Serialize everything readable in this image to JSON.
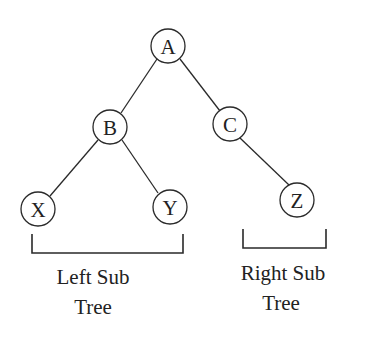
{
  "diagram": {
    "type": "binary-tree",
    "nodes": [
      {
        "id": "A",
        "label": "A",
        "cx": 168,
        "cy": 46,
        "r": 17
      },
      {
        "id": "B",
        "label": "B",
        "cx": 110,
        "cy": 127,
        "r": 17
      },
      {
        "id": "C",
        "label": "C",
        "cx": 230,
        "cy": 124,
        "r": 17
      },
      {
        "id": "X",
        "label": "X",
        "cx": 38,
        "cy": 209,
        "r": 17
      },
      {
        "id": "Y",
        "label": "Y",
        "cx": 170,
        "cy": 207,
        "r": 17
      },
      {
        "id": "Z",
        "label": "Z",
        "cx": 297,
        "cy": 200,
        "r": 17
      }
    ],
    "edges": [
      {
        "from": "A",
        "to": "B"
      },
      {
        "from": "A",
        "to": "C"
      },
      {
        "from": "B",
        "to": "X"
      },
      {
        "from": "B",
        "to": "Y"
      },
      {
        "from": "C",
        "to": "Z"
      }
    ],
    "groups": [
      {
        "id": "left-subtree",
        "line1": "Left Sub",
        "line2": "Tree"
      },
      {
        "id": "right-subtree",
        "line1": "Right Sub",
        "line2": "Tree"
      }
    ]
  }
}
